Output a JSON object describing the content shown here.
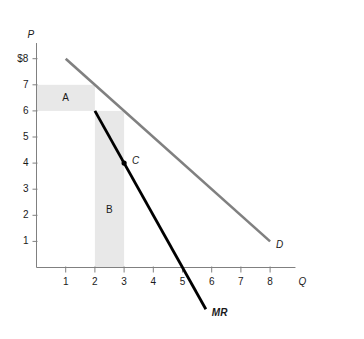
{
  "chart_data": {
    "type": "line",
    "title": "",
    "xlabel": "Q",
    "ylabel": "P",
    "xlim": [
      0,
      8.8
    ],
    "ylim": [
      0,
      8.6
    ],
    "grid": false,
    "legend_position": "inline-curve-labels",
    "xticks": [
      "1",
      "2",
      "3",
      "4",
      "5",
      "6",
      "7",
      "8"
    ],
    "xtick_values": [
      1,
      2,
      3,
      4,
      5,
      6,
      7,
      8
    ],
    "yticks": [
      "1",
      "2",
      "3",
      "4",
      "5",
      "6",
      "7",
      "$8"
    ],
    "ytick_values": [
      1,
      2,
      3,
      4,
      5,
      6,
      7,
      8
    ],
    "series": [
      {
        "name": "D",
        "label": "D",
        "color": "#808080",
        "width": 2.6,
        "points": [
          [
            1,
            8
          ],
          [
            8,
            1
          ]
        ]
      },
      {
        "name": "MR",
        "label": "MR",
        "color": "#000000",
        "width": 2.8,
        "points": [
          [
            2,
            6
          ],
          [
            5.8,
            -1.6
          ]
        ]
      }
    ],
    "annotations": [
      {
        "name": "point-c",
        "label": "C",
        "x": 3,
        "y": 4,
        "marker": "dot",
        "color": "#000000",
        "label_dx": 8,
        "label_dy": -2
      }
    ],
    "shaded_regions": [
      {
        "name": "region-a",
        "label": "A",
        "color": "#e8e8e8",
        "x0": 0,
        "x1": 2,
        "y0": 6,
        "y1": 7,
        "label_x": 1.0,
        "label_y": 6.5
      },
      {
        "name": "region-b",
        "label": "B",
        "color": "#e8e8e8",
        "x0": 2,
        "x1": 3,
        "y0": 0,
        "y1": 6,
        "label_x": 2.5,
        "label_y": 2.2
      }
    ],
    "axis_color": "#808080",
    "tick_color": "#808080",
    "text_color": "#1a1a1a",
    "background": "#ffffff"
  }
}
